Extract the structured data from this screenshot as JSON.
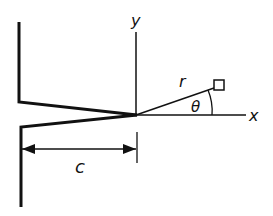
{
  "diagram": {
    "labels": {
      "y_axis": "y",
      "x_axis": "x",
      "radius": "r",
      "angle": "θ",
      "crack_length": "c"
    },
    "colors": {
      "stroke": "#111111",
      "background": "#ffffff"
    }
  }
}
